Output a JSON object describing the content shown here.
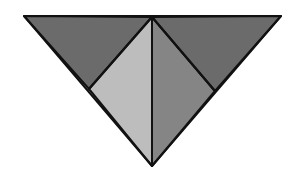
{
  "diagram": {
    "title": "",
    "shape": "inverted triangle divided into four triangles",
    "canvas": {
      "width": 301,
      "height": 180,
      "background": "#ffffff"
    },
    "stroke": {
      "color": "#111111",
      "width": 2
    },
    "vertices": {
      "top_left": [
        24,
        16
      ],
      "top_center": [
        152,
        17
      ],
      "top_right": [
        281,
        16
      ],
      "bottom": [
        152,
        166
      ],
      "left_mid": [
        89,
        89
      ],
      "right_mid": [
        215,
        91
      ]
    },
    "regions": [
      {
        "name": "top-left-triangle",
        "points": "24,16 152,17 89,89",
        "fill": "#6b6b6b"
      },
      {
        "name": "left-inner-triangle",
        "points": "89,89 152,17 152,166",
        "fill": "#bdbdbd"
      },
      {
        "name": "right-inner-triangle",
        "points": "152,17 215,91 152,166",
        "fill": "#858585"
      },
      {
        "name": "top-right-triangle",
        "points": "152,17 281,16 215,91",
        "fill": "#6b6b6b"
      }
    ]
  }
}
